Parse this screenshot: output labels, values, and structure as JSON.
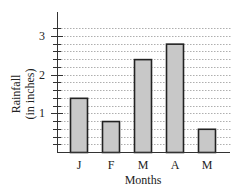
{
  "chart_data": {
    "type": "bar",
    "title": "",
    "xlabel": "Months",
    "ylabel": "Rainfall (in inches)",
    "ylabel_lines": [
      "Rainfall",
      "(in inches)"
    ],
    "categories": [
      "J",
      "F",
      "M",
      "A",
      "M"
    ],
    "values": [
      1.4,
      0.8,
      2.4,
      2.8,
      0.6
    ],
    "ylim": [
      0,
      3.4
    ],
    "yticks_labeled": [
      1,
      2,
      3
    ],
    "minor_tick_step": 0.2,
    "grid": true,
    "grid_style": "dotted horizontal",
    "legend": null,
    "bar_color": "#c8c8c8",
    "bar_edge_color": "#222222"
  }
}
